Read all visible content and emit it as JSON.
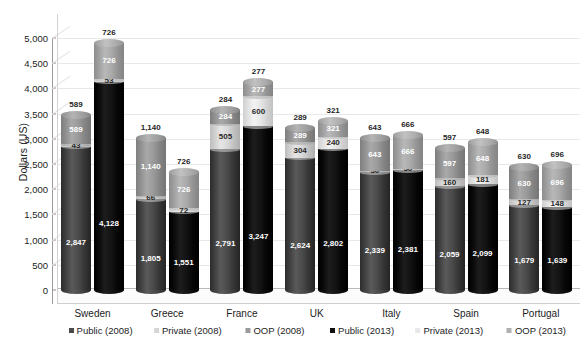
{
  "chart_data": {
    "type": "bar",
    "subtype": "stacked-3d-cylinder",
    "title": "",
    "xlabel": "",
    "ylabel": "Dollars (US)",
    "ylim": [
      0,
      5000
    ],
    "ytick_step": 500,
    "ytick_labels": [
      "5,000",
      "4,500",
      "4,000",
      "3,500",
      "3,000",
      "2,500",
      "2,000",
      "1,500",
      "1,000",
      "500",
      "0"
    ],
    "ytick_values": [
      5000,
      4500,
      4000,
      3500,
      3000,
      2500,
      2000,
      1500,
      1000,
      500,
      0
    ],
    "grid": true,
    "legend_position": "bottom",
    "categories": [
      "Sweden",
      "Greece",
      "France",
      "UK",
      "Italy",
      "Spain",
      "Portugal"
    ],
    "series": [
      {
        "name": "Public (2008)",
        "year": "2008",
        "component": "Public",
        "color": "#3f3f3f",
        "values": [
          2847,
          1805,
          2791,
          2624,
          2339,
          2059,
          1679
        ]
      },
      {
        "name": "Private (2008)",
        "year": "2008",
        "component": "Private",
        "color": "#d5d5d5",
        "values": [
          43,
          66,
          505,
          304,
          30,
          160,
          127
        ]
      },
      {
        "name": "OOP (2008)",
        "year": "2008",
        "component": "OOP",
        "color": "#9a9a9a",
        "values": [
          589,
          1140,
          284,
          289,
          643,
          597,
          630
        ]
      },
      {
        "name": "Public (2013)",
        "year": "2013",
        "component": "Public",
        "color": "#000000",
        "values": [
          4128,
          1551,
          3247,
          2802,
          2381,
          2099,
          1639
        ]
      },
      {
        "name": "Private (2013)",
        "year": "2013",
        "component": "Private",
        "color": "#e8e8e8",
        "values": [
          53,
          72,
          600,
          240,
          30,
          181,
          148
        ]
      },
      {
        "name": "OOP (2013)",
        "year": "2013",
        "component": "OOP",
        "color": "#aaaaaa",
        "values": [
          726,
          726,
          277,
          321,
          666,
          648,
          696
        ]
      }
    ],
    "bar_labels": {
      "Sweden": {
        "2008": {
          "public": "2,847",
          "private": "43",
          "oop": "589"
        },
        "2013": {
          "public": "4,128",
          "private": "53",
          "oop": "726"
        }
      },
      "Greece": {
        "2008": {
          "public": "1,805",
          "private": "66",
          "oop": "1,140"
        },
        "2013": {
          "public": "1,551",
          "private": "72",
          "oop": "726"
        }
      },
      "France": {
        "2008": {
          "public": "2,791",
          "private": "505",
          "oop": "284"
        },
        "2013": {
          "public": "3,247",
          "private": "600",
          "oop": "277"
        }
      },
      "UK": {
        "2008": {
          "public": "2,624",
          "private": "304",
          "oop": "289"
        },
        "2013": {
          "public": "2,802",
          "private": "240",
          "oop": "321"
        }
      },
      "Italy": {
        "2008": {
          "public": "2,339",
          "private": "30",
          "oop": "643"
        },
        "2013": {
          "public": "2,381",
          "private": "30",
          "oop": "666"
        }
      },
      "Spain": {
        "2008": {
          "public": "2,059",
          "private": "160",
          "oop": "597"
        },
        "2013": {
          "public": "2,099",
          "private": "181",
          "oop": "648"
        }
      },
      "Portugal": {
        "2008": {
          "public": "1,679",
          "private": "127",
          "oop": "630"
        },
        "2013": {
          "public": "1,639",
          "private": "148",
          "oop": "696"
        }
      }
    }
  },
  "axis": {
    "y_title": "Dollars (US)"
  },
  "legend": {
    "items": [
      {
        "label": "Public (2008)",
        "color": "#4a4a4a"
      },
      {
        "label": "Private (2008)",
        "color": "#d5d5d5"
      },
      {
        "label": "OOP (2008)",
        "color": "#9a9a9a"
      },
      {
        "label": "Public (2013)",
        "color": "#101010"
      },
      {
        "label": "Private (2013)",
        "color": "#e8e8e8"
      },
      {
        "label": "OOP (2013)",
        "color": "#b0b0b0"
      }
    ]
  }
}
